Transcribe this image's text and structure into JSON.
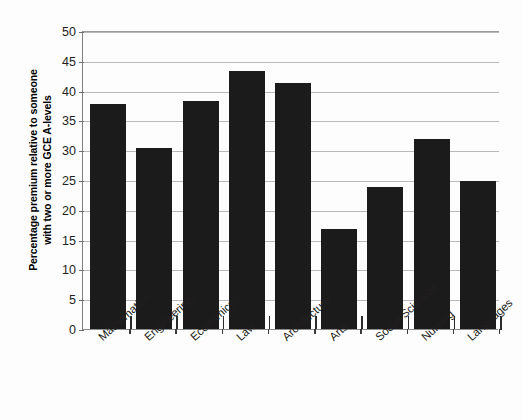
{
  "chart_data": {
    "type": "bar",
    "title": "",
    "subtitle": "",
    "xlabel": "",
    "ylabel": "Percentage premium relative to someone with two or more GCE A-levels",
    "ylabel_lines": [
      "Percentage premium relative to someone",
      "with two or more GCE A-levels"
    ],
    "categories": [
      "Mathematics",
      "Engineering",
      "Economics",
      "Law",
      "Architecture",
      "Arts",
      "Social Sciences",
      "Nursing",
      "Languages"
    ],
    "values": [
      38,
      30.5,
      38.5,
      43.5,
      41.5,
      17,
      24,
      32,
      25
    ],
    "ylim": [
      0,
      50
    ],
    "ytick_step": 5,
    "ytick_labels": [
      "0",
      "5",
      "10",
      "15",
      "20",
      "25",
      "30",
      "35",
      "40",
      "45",
      "50"
    ],
    "ytick_values": [
      0,
      5,
      10,
      15,
      20,
      25,
      30,
      35,
      40,
      45,
      50
    ],
    "grid": true,
    "grid_axis": "y",
    "legend": false,
    "legend_position": "none",
    "bar_color": "#1b1b1b",
    "grid_color": "#b9b9b9",
    "axis_color": "#8d8d8d",
    "background": "#ffffff"
  }
}
